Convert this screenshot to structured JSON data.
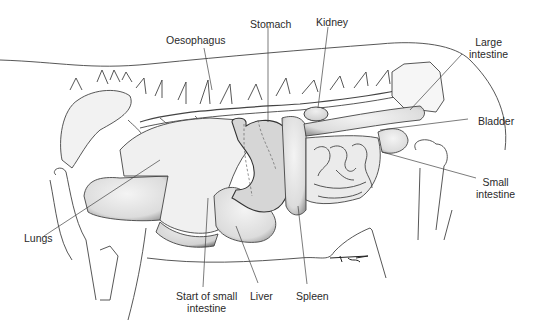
{
  "figure": {
    "signature": "TJP"
  },
  "labels": {
    "oesophagus": "Oesophagus",
    "stomach": "Stomach",
    "kidney": "Kidney",
    "large_intestine_1": "Large",
    "large_intestine_2": "intestine",
    "bladder": "Bladder",
    "small_intestine_1": "Small",
    "small_intestine_2": "intestine",
    "lungs": "Lungs",
    "start_small_intestine_1": "Start of small",
    "start_small_intestine_2": "intestine",
    "liver": "Liver",
    "spleen": "Spleen"
  },
  "colors": {
    "line": "#3a3a3a",
    "organ_fill": "#e4e4e4",
    "stomach_fill": "#d4d4d4",
    "text": "#2a2a2a"
  }
}
